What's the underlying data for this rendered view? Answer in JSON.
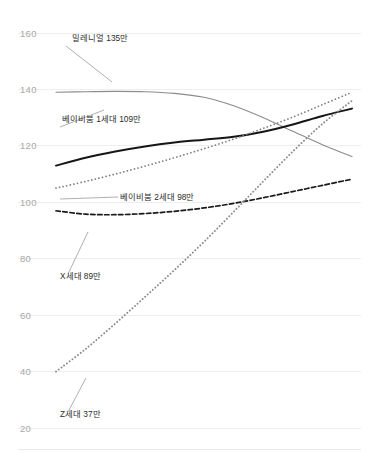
{
  "chart_data": {
    "type": "line",
    "title": "",
    "xlabel": "",
    "ylabel": "",
    "ylim": [
      20,
      160
    ],
    "yticks": [
      160,
      140,
      120,
      100,
      80,
      60,
      40,
      20
    ],
    "ytick_labels": [
      "160",
      "140",
      "120",
      "100",
      "80",
      "60",
      "40",
      "20"
    ],
    "grid": true,
    "legend": "inline-annotations",
    "x": [
      0,
      1,
      2,
      3,
      4,
      5,
      6,
      7,
      8,
      9,
      10
    ],
    "series": [
      {
        "name": "밀레니얼",
        "label": "밀레니얼 135만",
        "value_label": "135만",
        "color": "#8c8c8c",
        "style": "solid",
        "width": 1.1,
        "values": [
          139.0,
          139.2,
          139.3,
          139.2,
          138.6,
          137.2,
          134.2,
          130.0,
          125.2,
          120.4,
          116.2
        ]
      },
      {
        "name": "베이비붐 1세대",
        "label": "베이비붐 1세대 109만",
        "value_label": "109만",
        "color": "#161616",
        "style": "solid",
        "width": 2.0,
        "values": [
          113.0,
          115.8,
          118.0,
          119.8,
          121.2,
          122.2,
          123.2,
          125.0,
          127.6,
          130.6,
          133.2
        ]
      },
      {
        "name": "베이비붐 2세대",
        "label": "베이비붐 2세대 98만",
        "value_label": "98만",
        "color": "#7d7d7d",
        "style": "dotted",
        "width": 1.7,
        "values": [
          105.0,
          107.4,
          110.0,
          112.8,
          115.8,
          119.0,
          122.4,
          126.2,
          130.2,
          134.6,
          139.0
        ]
      },
      {
        "name": "X세대",
        "label": "X세대 89만",
        "value_label": "89만",
        "color": "#1a1a1a",
        "style": "dashed",
        "width": 1.7,
        "values": [
          97.0,
          95.8,
          95.6,
          96.0,
          96.8,
          98.0,
          99.6,
          101.6,
          103.8,
          106.0,
          108.2
        ]
      },
      {
        "name": "Z세대",
        "label": "Z세대 37만",
        "value_label": "37만",
        "color": "#8a8a8a",
        "style": "beaded",
        "width": 1.9,
        "values": [
          40.0,
          48.0,
          57.0,
          66.4,
          76.0,
          86.0,
          96.6,
          107.4,
          118.0,
          127.8,
          136.0
        ]
      }
    ],
    "annotations": [
      {
        "key": "millennial",
        "text": "밀레니얼 135만",
        "text_x": 72,
        "text_y": 41,
        "leader": "M 66 46 L 112 82"
      },
      {
        "key": "boomer1",
        "text": "베이비붐 1세대 109만",
        "text_x": 62,
        "text_y": 122,
        "leader": "M 60 127 L 104 110"
      },
      {
        "key": "boomer2",
        "text": "베이비붐 2세대 98만",
        "text_x": 120,
        "text_y": 200,
        "leader": "M 118 197 L 60 199"
      },
      {
        "key": "genx",
        "text": "X세대 89만",
        "text_x": 60,
        "text_y": 279,
        "leader": "M 68 274 L 88 232"
      },
      {
        "key": "genz",
        "text": "Z세대 37만",
        "text_x": 60,
        "text_y": 417,
        "leader": "M 68 412 L 86 378"
      }
    ]
  }
}
